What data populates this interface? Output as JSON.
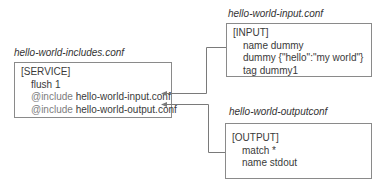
{
  "includes_file": {
    "title": "hello-world-includes.conf",
    "section": "[SERVICE]",
    "lines": [
      {
        "text": "flush 1"
      },
      {
        "keyword": "@include",
        "value": "hello-world-input.conf"
      },
      {
        "keyword": "@include",
        "value": "hello-world-output.conf"
      }
    ]
  },
  "input_file": {
    "title": "hello-world-input.conf",
    "section": "[INPUT]",
    "lines": [
      "name dummy",
      "dummy {\"hello\":\"my world\"}",
      "tag dummy1"
    ]
  },
  "output_file": {
    "title": "hello-world-outputconf",
    "section": "[OUTPUT]",
    "lines": [
      "match *",
      "name stdout"
    ]
  },
  "colors": {
    "border": "#8a8a8a",
    "connector": "#7a7a7a",
    "text": "#3a3a3a"
  }
}
